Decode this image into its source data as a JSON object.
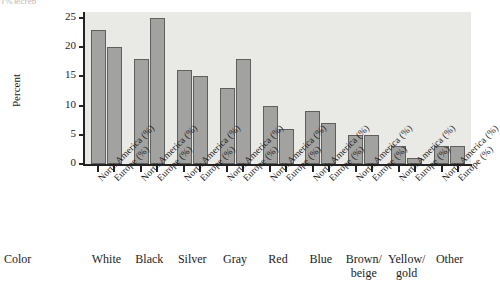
{
  "top_fragment": "(%)ecrep",
  "axis": {
    "ylabel": "Percent",
    "yticks": [
      "0",
      "5",
      "10",
      "15",
      "20",
      "25"
    ],
    "category_heading": "Color"
  },
  "series_labels": {
    "north_america": "North America (%)",
    "europe": "Europe (%)"
  },
  "colors": {
    "bar_fill": "#a2a2a0",
    "bar_stroke": "#5f5f5e",
    "plot_background": "#e9e9e6",
    "axis": "#232323",
    "text": "#1b1b1b"
  },
  "chart_data": {
    "type": "bar",
    "title": "",
    "xlabel": "Color",
    "ylabel": "Percent",
    "ylim": [
      0,
      26
    ],
    "yticks": [
      0,
      5,
      10,
      15,
      20,
      25
    ],
    "grid": false,
    "legend": "none",
    "categories": [
      "White",
      "Black",
      "Silver",
      "Gray",
      "Red",
      "Blue",
      "Brown/\nbeige",
      "Yellow/\ngold",
      "Other"
    ],
    "series": [
      {
        "name": "North America (%)",
        "values": [
          23,
          18,
          16,
          13,
          10,
          9,
          5,
          3,
          3
        ]
      },
      {
        "name": "Europe (%)",
        "values": [
          20,
          25,
          15,
          18,
          6,
          7,
          5,
          1,
          3
        ]
      }
    ]
  }
}
